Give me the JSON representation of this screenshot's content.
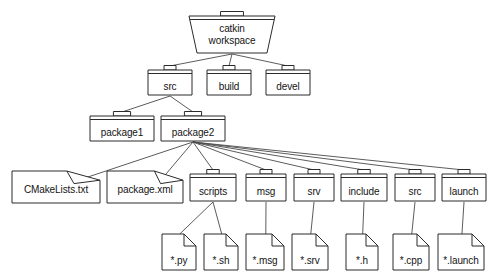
{
  "diagram": {
    "type": "folder-tree",
    "background_color": "#ffffff",
    "line_color": "#4a4a4a",
    "shape_stroke_color": "#2b2b2b",
    "shape_fill_color": "#ffffff",
    "text_color": "#141414",
    "nodes": [
      {
        "id": "ws",
        "label": "catkin\nworkspace",
        "label_line1": "catkin",
        "label_line2": "workspace",
        "shape": "open-folder",
        "level": 0,
        "x": 188,
        "y": 10,
        "w": 88,
        "h": 44
      },
      {
        "id": "src",
        "label": "src",
        "shape": "folder",
        "level": 1,
        "x": 147,
        "y": 64,
        "w": 46,
        "h": 32
      },
      {
        "id": "build",
        "label": "build",
        "shape": "folder",
        "level": 1,
        "x": 206,
        "y": 64,
        "w": 46,
        "h": 32
      },
      {
        "id": "devel",
        "label": "devel",
        "shape": "folder",
        "level": 1,
        "x": 265,
        "y": 64,
        "w": 46,
        "h": 32
      },
      {
        "id": "package1",
        "label": "package1",
        "shape": "folder",
        "level": 2,
        "x": 89,
        "y": 110,
        "w": 66,
        "h": 32
      },
      {
        "id": "package2",
        "label": "package2",
        "shape": "folder",
        "level": 2,
        "x": 160,
        "y": 110,
        "w": 66,
        "h": 32
      },
      {
        "id": "cmakelists",
        "label": "CMakeLists.txt",
        "shape": "document",
        "level": 3,
        "x": 11,
        "y": 170,
        "w": 90,
        "h": 34
      },
      {
        "id": "packagexml",
        "label": "package.xml",
        "shape": "document",
        "level": 3,
        "x": 106,
        "y": 170,
        "w": 78,
        "h": 34
      },
      {
        "id": "scripts",
        "label": "scripts",
        "shape": "folder",
        "level": 3,
        "x": 189,
        "y": 168,
        "w": 48,
        "h": 34
      },
      {
        "id": "msg",
        "label": "msg",
        "shape": "folder",
        "level": 3,
        "x": 245,
        "y": 168,
        "w": 42,
        "h": 34
      },
      {
        "id": "srv",
        "label": "srv",
        "shape": "folder",
        "level": 3,
        "x": 293,
        "y": 168,
        "w": 42,
        "h": 34
      },
      {
        "id": "include",
        "label": "include",
        "shape": "folder",
        "level": 3,
        "x": 340,
        "y": 168,
        "w": 48,
        "h": 34
      },
      {
        "id": "srcpkg",
        "label": "src",
        "shape": "folder",
        "level": 3,
        "x": 394,
        "y": 168,
        "w": 42,
        "h": 34
      },
      {
        "id": "launch",
        "label": "launch",
        "shape": "folder",
        "level": 3,
        "x": 441,
        "y": 168,
        "w": 46,
        "h": 34
      },
      {
        "id": "py",
        "label": "*.py",
        "shape": "file",
        "level": 4,
        "x": 161,
        "y": 233,
        "w": 36,
        "h": 38
      },
      {
        "id": "sh",
        "label": "*.sh",
        "shape": "file",
        "level": 4,
        "x": 203,
        "y": 233,
        "w": 36,
        "h": 38
      },
      {
        "id": "msgfile",
        "label": "*.msg",
        "shape": "file",
        "level": 4,
        "x": 245,
        "y": 233,
        "w": 40,
        "h": 38
      },
      {
        "id": "srvfile",
        "label": "*.srv",
        "shape": "file",
        "level": 4,
        "x": 291,
        "y": 233,
        "w": 38,
        "h": 38
      },
      {
        "id": "hfile",
        "label": "*.h",
        "shape": "file",
        "level": 4,
        "x": 345,
        "y": 233,
        "w": 34,
        "h": 38
      },
      {
        "id": "cppfile",
        "label": "*.cpp",
        "shape": "file",
        "level": 4,
        "x": 392,
        "y": 233,
        "w": 38,
        "h": 38
      },
      {
        "id": "launchfile",
        "label": "*.launch",
        "shape": "file",
        "level": 4,
        "x": 437,
        "y": 233,
        "w": 48,
        "h": 38
      }
    ],
    "edges": [
      {
        "from": "ws",
        "to": "src"
      },
      {
        "from": "ws",
        "to": "build"
      },
      {
        "from": "ws",
        "to": "devel"
      },
      {
        "from": "src",
        "to": "package1"
      },
      {
        "from": "src",
        "to": "package2"
      },
      {
        "from": "package2",
        "to": "cmakelists"
      },
      {
        "from": "package2",
        "to": "packagexml"
      },
      {
        "from": "package2",
        "to": "scripts"
      },
      {
        "from": "package2",
        "to": "msg"
      },
      {
        "from": "package2",
        "to": "srv"
      },
      {
        "from": "package2",
        "to": "include"
      },
      {
        "from": "package2",
        "to": "srcpkg"
      },
      {
        "from": "package2",
        "to": "launch"
      },
      {
        "from": "scripts",
        "to": "py"
      },
      {
        "from": "scripts",
        "to": "sh"
      },
      {
        "from": "msg",
        "to": "msgfile"
      },
      {
        "from": "srv",
        "to": "srvfile"
      },
      {
        "from": "include",
        "to": "hfile"
      },
      {
        "from": "srcpkg",
        "to": "cppfile"
      },
      {
        "from": "launch",
        "to": "launchfile"
      }
    ]
  }
}
